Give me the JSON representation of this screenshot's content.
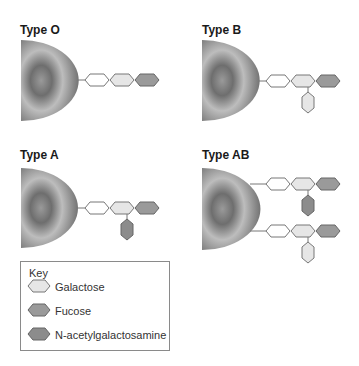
{
  "panels": [
    {
      "id": "type-o",
      "title": "Type O"
    },
    {
      "id": "type-b",
      "title": "Type B"
    },
    {
      "id": "type-a",
      "title": "Type A"
    },
    {
      "id": "type-ab",
      "title": "Type AB"
    }
  ],
  "key": {
    "title": "Key",
    "items": [
      {
        "label": "Galactose",
        "color": "#e6e6e6"
      },
      {
        "label": "Fucose",
        "color": "#9a9a9a"
      },
      {
        "label": "N-acetylgalactosamine",
        "color": "#8c8c8c"
      }
    ]
  },
  "colors": {
    "base_sugar": "#ffffff",
    "galactose": "#e6e6e6",
    "fucose": "#9a9a9a",
    "n_acetylgalactosamine": "#8c8c8c",
    "outline": "#777777",
    "cell_dark": "#4a4a4a",
    "cell_light": "#b8b8b8"
  }
}
